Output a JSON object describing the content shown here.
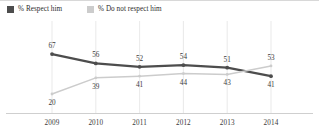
{
  "legend": {
    "position": "top-left",
    "entries": [
      {
        "label": "% Respect him",
        "color": "#4d4d4d",
        "swatch_name": "legend-swatch-respect"
      },
      {
        "label": "% Do not respect him",
        "color": "#cccccc",
        "swatch_name": "legend-swatch-do-not-respect"
      }
    ]
  },
  "chart_data": {
    "type": "line",
    "title": "",
    "subtitle": "",
    "xlabel": "",
    "ylabel": "",
    "grid": "vertical",
    "ylim": [
      0,
      80
    ],
    "categories": [
      "2009",
      "2010",
      "2011",
      "2012",
      "2013",
      "2014"
    ],
    "series": [
      {
        "name": "% Respect him",
        "color": "#4d4d4d",
        "values": [
          67,
          56,
          52,
          54,
          51,
          41
        ],
        "labels": [
          "67",
          "56",
          "52",
          "54",
          "51",
          "41"
        ],
        "label_side": [
          "above",
          "above",
          "above",
          "above",
          "above",
          "below"
        ]
      },
      {
        "name": "% Do not respect him",
        "color": "#cccccc",
        "values": [
          20,
          39,
          41,
          44,
          43,
          53
        ],
        "labels": [
          "20",
          "39",
          "41",
          "44",
          "43",
          "53"
        ],
        "label_side": [
          "below",
          "below",
          "below",
          "below",
          "below",
          "above"
        ]
      }
    ],
    "legend_position": "top-left",
    "annotations": []
  },
  "xaxis": {
    "ticks": [
      "2009",
      "2010",
      "2011",
      "2012",
      "2013",
      "2014"
    ]
  }
}
